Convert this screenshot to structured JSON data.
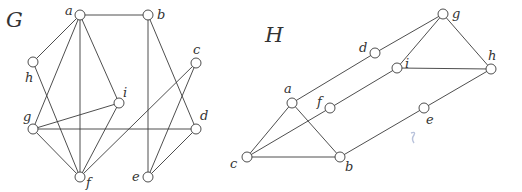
{
  "graphs": [
    {
      "title": "G",
      "title_pos": [
        6,
        27
      ],
      "node_radius": 5,
      "nodes": [
        {
          "id": "a",
          "x": 80,
          "y": 15,
          "lx": -15,
          "ly": 0
        },
        {
          "id": "b",
          "x": 148,
          "y": 15,
          "lx": 9,
          "ly": 4
        },
        {
          "id": "c",
          "x": 196,
          "y": 63,
          "lx": -3,
          "ly": -9
        },
        {
          "id": "h",
          "x": 33,
          "y": 62,
          "lx": -8,
          "ly": 20
        },
        {
          "id": "i",
          "x": 119,
          "y": 103,
          "lx": 4,
          "ly": -6
        },
        {
          "id": "g",
          "x": 33,
          "y": 129,
          "lx": -10,
          "ly": -8
        },
        {
          "id": "d",
          "x": 196,
          "y": 129,
          "lx": 4,
          "ly": -9
        },
        {
          "id": "f",
          "x": 80,
          "y": 177,
          "lx": 6,
          "ly": 10
        },
        {
          "id": "e",
          "x": 148,
          "y": 177,
          "lx": -16,
          "ly": 4
        }
      ],
      "edges": [
        [
          "a",
          "b"
        ],
        [
          "a",
          "h"
        ],
        [
          "a",
          "g"
        ],
        [
          "a",
          "f"
        ],
        [
          "a",
          "i"
        ],
        [
          "b",
          "e"
        ],
        [
          "b",
          "d"
        ],
        [
          "c",
          "f"
        ],
        [
          "c",
          "e"
        ],
        [
          "h",
          "f"
        ],
        [
          "i",
          "g"
        ],
        [
          "i",
          "f"
        ],
        [
          "g",
          "d"
        ],
        [
          "g",
          "f"
        ],
        [
          "d",
          "e"
        ]
      ]
    },
    {
      "title": "H",
      "title_pos": [
        265,
        42
      ],
      "node_radius": 5,
      "nodes": [
        {
          "id": "g",
          "x": 443,
          "y": 14,
          "lx": 9,
          "ly": 4
        },
        {
          "id": "d",
          "x": 375,
          "y": 53,
          "lx": -16,
          "ly": -1
        },
        {
          "id": "i",
          "x": 397,
          "y": 68,
          "lx": 8,
          "ly": 0
        },
        {
          "id": "h",
          "x": 491,
          "y": 69,
          "lx": -3,
          "ly": -9
        },
        {
          "id": "a",
          "x": 292,
          "y": 103,
          "lx": -8,
          "ly": -10
        },
        {
          "id": "f",
          "x": 330,
          "y": 108,
          "lx": -13,
          "ly": -2
        },
        {
          "id": "e",
          "x": 424,
          "y": 108,
          "lx": 2,
          "ly": 16
        },
        {
          "id": "c",
          "x": 247,
          "y": 157,
          "lx": -17,
          "ly": 11
        },
        {
          "id": "b",
          "x": 340,
          "y": 157,
          "lx": 5,
          "ly": 14
        }
      ],
      "edges": [
        [
          "g",
          "d"
        ],
        [
          "g",
          "i"
        ],
        [
          "g",
          "h"
        ],
        [
          "d",
          "a"
        ],
        [
          "i",
          "h"
        ],
        [
          "i",
          "f"
        ],
        [
          "h",
          "e"
        ],
        [
          "a",
          "c"
        ],
        [
          "a",
          "b"
        ],
        [
          "f",
          "c"
        ],
        [
          "c",
          "b"
        ],
        [
          "e",
          "b"
        ]
      ]
    }
  ],
  "colors": {
    "stroke": "#3a3a3a",
    "text": "#333333",
    "artifact": "#9aa8cc"
  }
}
